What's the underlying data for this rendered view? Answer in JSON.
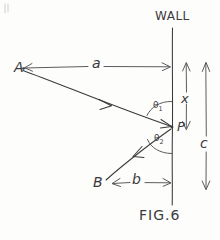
{
  "figure": {
    "caption": "FIG.6",
    "wall_label": "WALL",
    "points": [
      {
        "id": "point-a",
        "label": "A",
        "x": 22,
        "y": 68
      },
      {
        "id": "point-b",
        "label": "B",
        "x": 102,
        "y": 184
      },
      {
        "id": "point-p",
        "label": "P",
        "x": 172,
        "y": 127
      }
    ],
    "distances": [
      {
        "id": "distance-a",
        "label": "a",
        "description": "horizontal distance from A to wall"
      },
      {
        "id": "distance-b",
        "label": "b",
        "description": "horizontal distance from B to wall"
      },
      {
        "id": "distance-c",
        "label": "c",
        "description": "vertical distance along wall from top to bottom"
      },
      {
        "id": "distance-x",
        "label": "x",
        "description": "vertical distance along wall from top to point P"
      }
    ],
    "angles": [
      {
        "id": "angle-theta1",
        "label": "θ",
        "subscript": "1",
        "description": "angle between incoming ray AP and wall above P"
      },
      {
        "id": "angle-theta2",
        "label": "θ",
        "subscript": "2",
        "description": "angle between outgoing ray PB and wall below P"
      }
    ],
    "rays": [
      {
        "id": "ray-a-to-p",
        "from": "A",
        "to": "P",
        "description": "incident ray from A to P"
      },
      {
        "id": "ray-p-to-b",
        "from": "P",
        "to": "B",
        "description": "reflected ray from P to B"
      }
    ],
    "colors": {
      "ink": "#3a3a3c",
      "paper": "#fdfdfc"
    }
  }
}
